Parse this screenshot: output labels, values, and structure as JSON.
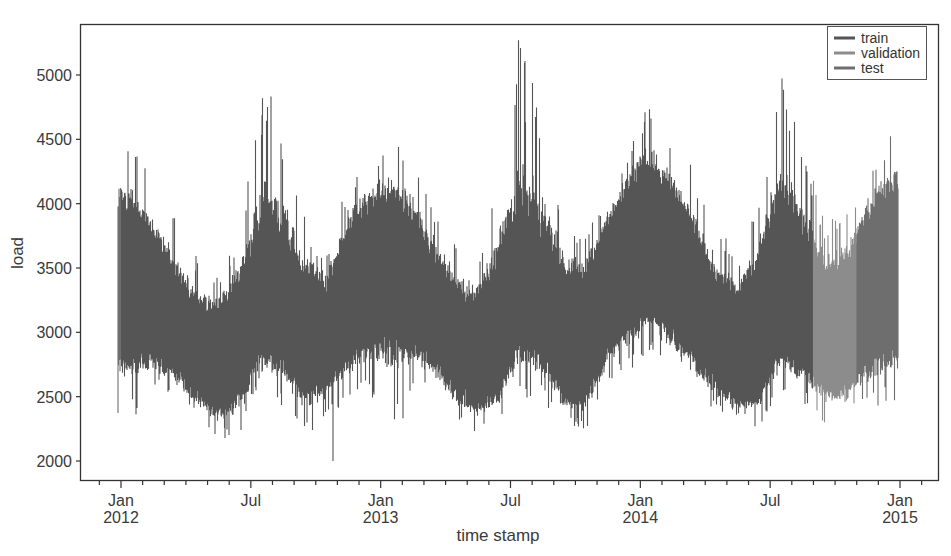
{
  "chart_data": {
    "type": "line",
    "title": "",
    "xlabel": "time stamp",
    "ylabel": "load",
    "ylim": [
      1800,
      5400
    ],
    "yticks": [
      2000,
      2500,
      3000,
      3500,
      4000,
      4500,
      5000
    ],
    "ytick_labels": [
      "2000",
      "2500",
      "3000",
      "3500",
      "4000",
      "4500",
      "5000"
    ],
    "xticks": [
      {
        "date": "2012-01",
        "line1": "Jan",
        "line2": "2012"
      },
      {
        "date": "2012-07",
        "line1": "Jul",
        "line2": ""
      },
      {
        "date": "2013-01",
        "line1": "Jan",
        "line2": "2013"
      },
      {
        "date": "2013-07",
        "line1": "Jul",
        "line2": ""
      },
      {
        "date": "2014-01",
        "line1": "Jan",
        "line2": "2014"
      },
      {
        "date": "2014-07",
        "line1": "Jul",
        "line2": ""
      },
      {
        "date": "2015-01",
        "line1": "Jan",
        "line2": "2015"
      }
    ],
    "xrange": [
      "2011-11",
      "2015-03"
    ],
    "grid": false,
    "legend_position": "upper right",
    "series": [
      {
        "name": "train",
        "color": "#555555",
        "start": "2012-01-01",
        "end": "2014-09-01"
      },
      {
        "name": "validation",
        "color": "#8c8c8c",
        "start": "2014-09-01",
        "end": "2014-11-01"
      },
      {
        "name": "test",
        "color": "#6e6e6e",
        "start": "2014-11-01",
        "end": "2014-12-31"
      }
    ],
    "envelope_monthly": {
      "months": [
        "2012-01",
        "2012-02",
        "2012-03",
        "2012-04",
        "2012-05",
        "2012-06",
        "2012-07",
        "2012-08",
        "2012-09",
        "2012-10",
        "2012-11",
        "2012-12",
        "2013-01",
        "2013-02",
        "2013-03",
        "2013-04",
        "2013-05",
        "2013-06",
        "2013-07",
        "2013-08",
        "2013-09",
        "2013-10",
        "2013-11",
        "2013-12",
        "2014-01",
        "2014-02",
        "2014-03",
        "2014-04",
        "2014-05",
        "2014-06",
        "2014-07",
        "2014-08",
        "2014-09",
        "2014-10",
        "2014-11",
        "2014-12"
      ],
      "max": [
        4500,
        4200,
        3900,
        3600,
        3450,
        3800,
        4900,
        4800,
        3900,
        3600,
        4200,
        4400,
        4650,
        4350,
        4050,
        3700,
        3500,
        4400,
        5270,
        4700,
        3900,
        3800,
        4100,
        4500,
        4900,
        4500,
        4300,
        3900,
        3550,
        4100,
        5080,
        4650,
        3900,
        3950,
        4300,
        4600
      ],
      "min": [
        2300,
        2600,
        2500,
        2400,
        2150,
        2200,
        2650,
        2400,
        2200,
        2300,
        2500,
        2500,
        2000,
        2550,
        2500,
        2300,
        2200,
        2300,
        2500,
        2450,
        2250,
        2250,
        2600,
        2700,
        2850,
        2600,
        2500,
        2400,
        2200,
        2250,
        2550,
        2450,
        2300,
        2350,
        2450,
        2400
      ],
      "typical_high": [
        4000,
        3750,
        3500,
        3250,
        3200,
        3450,
        3900,
        3750,
        3450,
        3400,
        3850,
        4000,
        4100,
        3900,
        3600,
        3350,
        3300,
        3600,
        4000,
        3750,
        3500,
        3500,
        3900,
        4150,
        4300,
        4100,
        3800,
        3450,
        3350,
        3600,
        4000,
        3800,
        3500,
        3550,
        3950,
        4100
      ],
      "typical_low": [
        2800,
        2750,
        2650,
        2450,
        2350,
        2450,
        2800,
        2700,
        2500,
        2550,
        2750,
        2900,
        3000,
        2850,
        2700,
        2500,
        2400,
        2500,
        2900,
        2750,
        2450,
        2450,
        2800,
        3000,
        3100,
        2950,
        2750,
        2550,
        2400,
        2450,
        2800,
        2700,
        2500,
        2500,
        2700,
        2800
      ]
    },
    "annotations": {
      "peak": {
        "date": "2013-07",
        "value": 5270
      },
      "min": {
        "date": "2012-12-31",
        "value": 2000
      }
    }
  },
  "legend": {
    "items": [
      {
        "label": "train",
        "color": "#555555"
      },
      {
        "label": "validation",
        "color": "#8c8c8c"
      },
      {
        "label": "test",
        "color": "#6e6e6e"
      }
    ]
  },
  "axes": {
    "xlabel": "time stamp",
    "ylabel": "load"
  }
}
